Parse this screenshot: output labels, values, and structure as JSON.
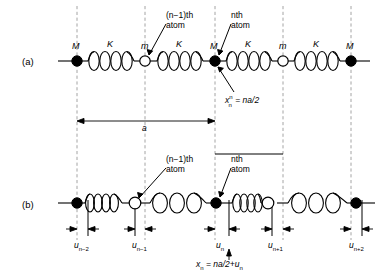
{
  "figure": {
    "stroke_color": "#000000",
    "dash_color": "#8a8a8a",
    "background": "#ffffff"
  },
  "panels": [
    {
      "id": "a",
      "label": "(a)",
      "description": "Equilibrium positions of a diatomic linear chain",
      "mass_labels": [
        "M",
        "K",
        "m",
        "K",
        "M",
        "K",
        "m",
        "K",
        "M"
      ],
      "annotations": [
        {
          "name": "atom-n-minus-1",
          "line1": "(n−1)th",
          "line2": "atom"
        },
        {
          "name": "atom-n",
          "line1": "nth",
          "line2": "atom"
        },
        {
          "name": "position-equation",
          "text": "x",
          "sup": "n",
          "sub": "n",
          "rest": " = na/2"
        }
      ],
      "dimension": {
        "name": "lattice-constant",
        "label": "a"
      }
    },
    {
      "id": "b",
      "label": "(b)",
      "description": "Displaced positions showing longitudinal displacements u",
      "annotations": [
        {
          "name": "atom-n-minus-1",
          "line1": "(n−1)th",
          "line2": "atom"
        },
        {
          "name": "atom-n",
          "line1": "nth",
          "line2": "atom"
        },
        {
          "name": "position-equation",
          "text": "x",
          "sub": "n",
          "rest": " = na/2+u",
          "rest_sub": "n"
        }
      ],
      "displacements": [
        {
          "name": "u-n-minus-2",
          "text": "u",
          "sub": "n−2"
        },
        {
          "name": "u-n-minus-1",
          "text": "u",
          "sub": "n−1"
        },
        {
          "name": "u-n",
          "text": "u",
          "sub": "n"
        },
        {
          "name": "u-n-plus-1",
          "text": "u",
          "sub": "n+1"
        },
        {
          "name": "u-n-plus-2",
          "text": "u",
          "sub": "n+2"
        }
      ]
    }
  ],
  "atoms": {
    "heavy_symbol": "M",
    "light_symbol": "m",
    "spring_symbol": "K",
    "heavy_fill": "#000000",
    "light_fill": "#ffffff"
  }
}
